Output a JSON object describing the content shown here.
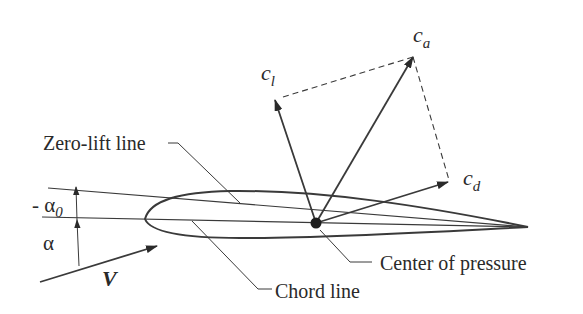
{
  "diagram": {
    "labels": {
      "zero_lift_line": "Zero-lift line",
      "chord_line": "Chord line",
      "center_of_pressure": "Center of pressure",
      "lift_coeff": {
        "base": "c",
        "sub": "l"
      },
      "resultant_coeff": {
        "base": "c",
        "sub": "a"
      },
      "drag_coeff": {
        "base": "c",
        "sub": "d"
      },
      "zero_lift_angle": {
        "prefix": "- ",
        "base": "α",
        "sub": "0"
      },
      "angle_of_attack": "α",
      "velocity": "V"
    },
    "colors": {
      "line": "#3a3a3a",
      "text": "#2a2a2a",
      "background": "#ffffff"
    }
  }
}
